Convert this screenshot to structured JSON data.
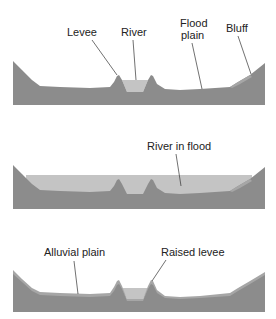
{
  "colors": {
    "ground": "#8c8c8c",
    "ground_light": "#a6a6a6",
    "water": "#c4c4c4",
    "leader": "#333333",
    "text": "#222222"
  },
  "panels": [
    {
      "id": "normal",
      "labels": {
        "levee": "Levee",
        "river": "River",
        "flood_line1": "Flood",
        "flood_line2": "plain",
        "bluff": "Bluff"
      }
    },
    {
      "id": "flood",
      "labels": {
        "river_in_flood": "River in flood"
      }
    },
    {
      "id": "aftermath",
      "labels": {
        "alluvial_plain": "Alluvial plain",
        "raised_levee": "Raised levee"
      }
    }
  ]
}
